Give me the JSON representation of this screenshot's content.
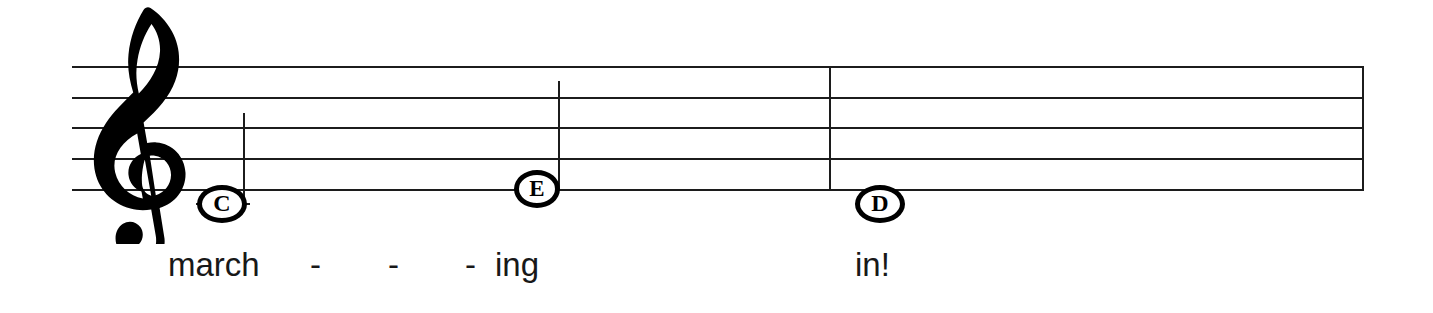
{
  "score": {
    "clef": {
      "name": "treble-clef",
      "glyph": "𝄞",
      "label": "Treble clef (G clef)"
    },
    "staff": {
      "line_count": 5,
      "left": 72,
      "right": 1363,
      "line_y": [
        66,
        97,
        127,
        158,
        189
      ],
      "line_color": "#1c1c1c"
    },
    "barlines": [
      {
        "name": "measure-barline",
        "x": 829,
        "type": "single"
      },
      {
        "name": "final-barline",
        "x": 1362,
        "type": "single"
      }
    ],
    "notes": [
      {
        "id": "note-1",
        "letter": "C",
        "pitch": "C4",
        "x": 222,
        "y": 204,
        "stem": "up",
        "stem_x": 244,
        "stem_top": 113,
        "ledger_line": true,
        "ledger_x": 196,
        "ledger_w": 54,
        "ledger_y": 204,
        "head_w": 50,
        "head_h": 38
      },
      {
        "id": "note-2",
        "letter": "E",
        "pitch": "E4",
        "x": 537,
        "y": 189,
        "stem": "up",
        "stem_x": 559,
        "stem_top": 81,
        "ledger_line": false,
        "head_w": 46,
        "head_h": 38
      },
      {
        "id": "note-3",
        "letter": "D",
        "pitch": "D4",
        "x": 880,
        "y": 204,
        "stem": "none",
        "ledger_line": false,
        "head_w": 50,
        "head_h": 38
      }
    ],
    "lyrics": [
      {
        "id": "lyric-1",
        "text": "march",
        "x": 168,
        "baseline": 278
      },
      {
        "id": "lyric-2",
        "text": "ing",
        "x": 495,
        "baseline": 278
      },
      {
        "id": "lyric-3",
        "text": "in!",
        "x": 855,
        "baseline": 278
      }
    ],
    "lyric_hyphens": [
      {
        "id": "hyphen-1",
        "text": "-",
        "x": 310,
        "baseline": 278
      },
      {
        "id": "hyphen-2",
        "text": "-",
        "x": 388,
        "baseline": 278
      },
      {
        "id": "hyphen-3",
        "text": "-",
        "x": 465,
        "baseline": 278
      }
    ]
  }
}
